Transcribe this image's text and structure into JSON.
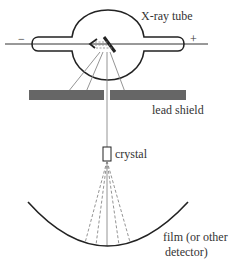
{
  "diagram": {
    "type": "x-ray diffraction apparatus (Laue setup)",
    "labels": {
      "tube": "X-ray tube",
      "cathode_sign": "−",
      "anode_sign": "+",
      "shield": "lead shield",
      "crystal": "crystal",
      "film_line1": "film (or other",
      "film_line2": "detector)"
    },
    "colors": {
      "line": "#222222",
      "shield": "#666666",
      "ray": "#888888",
      "background": "#ffffff"
    }
  }
}
